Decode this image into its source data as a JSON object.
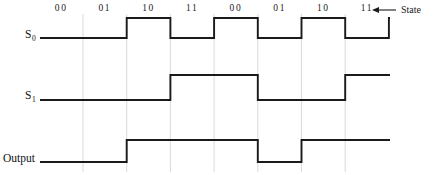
{
  "diagram": {
    "background_color": "#ffffff",
    "wave_color": "#1a1a1a",
    "grid_color": "#d0d0d0",
    "state_row": {
      "axis_label": "State",
      "arrow_icon": "left-arrow-icon",
      "labels": [
        "00",
        "01",
        "10",
        "11",
        "00",
        "01",
        "10",
        "11"
      ]
    },
    "signals": [
      {
        "name": "S0",
        "label_text": "S",
        "label_sub": "0",
        "levels": [
          0,
          1,
          0,
          1,
          0,
          1,
          0,
          1
        ],
        "high_y": 18,
        "low_y": 38
      },
      {
        "name": "S1",
        "label_text": "S",
        "label_sub": "1",
        "levels": [
          0,
          0,
          1,
          1,
          0,
          0,
          1,
          1
        ],
        "high_y": 75,
        "low_y": 100
      },
      {
        "name": "Output",
        "label_text": "Output",
        "label_sub": "",
        "levels": [
          0,
          1,
          1,
          1,
          0,
          1,
          1,
          1
        ],
        "high_y": 140,
        "low_y": 162
      }
    ],
    "geometry": {
      "wave_start_x": 40,
      "period_start_x": 83,
      "period_width": 43.7,
      "period_count": 8,
      "wave_end_x": 390,
      "grid_top_y": 14,
      "grid_bottom_y": 172
    }
  },
  "chart_data": {
    "type": "line",
    "xlabel": "",
    "ylabel": "",
    "categories": [
      "00",
      "01",
      "10",
      "11",
      "00",
      "01",
      "10",
      "11"
    ],
    "series": [
      {
        "name": "S0",
        "values": [
          0,
          1,
          0,
          1,
          0,
          1,
          0,
          1
        ]
      },
      {
        "name": "S1",
        "values": [
          0,
          0,
          1,
          1,
          0,
          0,
          1,
          1
        ]
      },
      {
        "name": "Output",
        "values": [
          0,
          1,
          1,
          1,
          0,
          1,
          1,
          1
        ]
      }
    ],
    "legend_position": "left-axis-labels",
    "grid": true,
    "ylim": [
      0,
      1
    ],
    "annotations": [
      "State"
    ]
  }
}
